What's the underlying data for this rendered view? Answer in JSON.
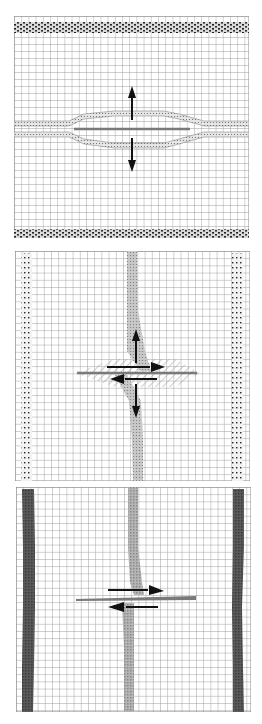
{
  "figure": {
    "colors": {
      "background": "#ffffff",
      "mesh": "#8c8c8c",
      "crack": "#7a7a7a",
      "arrow": "#111111",
      "marker_dark": "#4a4a4a",
      "marker_light": "#bdbdbd"
    },
    "panels": [
      {
        "id": "opening-mode",
        "box": {
          "x": 14,
          "y": 16,
          "w": 235,
          "h": 222
        },
        "marker_orientation": "horizontal",
        "marker_style": "speckled-dark",
        "arrows": [
          "up",
          "down"
        ]
      },
      {
        "id": "shear-mode-a",
        "box": {
          "x": 15,
          "y": 251,
          "w": 235,
          "h": 230
        },
        "marker_orientation": "vertical",
        "marker_style": "dotted",
        "arrows": [
          "up",
          "down",
          "right",
          "left"
        ]
      },
      {
        "id": "shear-mode-b",
        "box": {
          "x": 16,
          "y": 487,
          "w": 235,
          "h": 225
        },
        "marker_orientation": "vertical",
        "marker_style": "solid-gray",
        "arrows": [
          "right",
          "left"
        ]
      }
    ]
  }
}
